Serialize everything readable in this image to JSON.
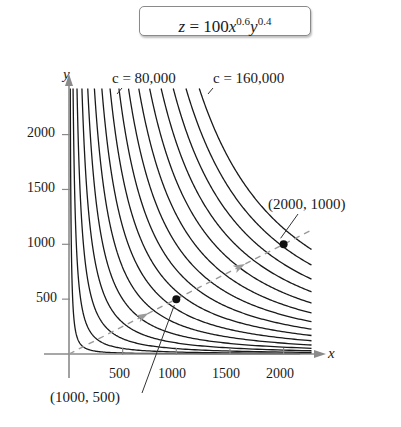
{
  "chart_data": {
    "type": "line",
    "formula": {
      "lhs": "z",
      "eq": " = 100",
      "var_x": "x",
      "exp_x": "0.6",
      "var_y": "y",
      "exp_y": "0.4"
    },
    "xlabel": "x",
    "ylabel": "y",
    "xlim": [
      0,
      2260
    ],
    "ylim": [
      0,
      2420
    ],
    "x_ticks": [
      500,
      1000,
      1500,
      2000
    ],
    "y_ticks": [
      500,
      1000,
      1500,
      2000
    ],
    "x_tick_labels": [
      "500",
      "1000",
      "1500",
      "2000"
    ],
    "y_tick_labels": [
      "500",
      "1000",
      "1500",
      "2000"
    ],
    "grid": false,
    "series": [
      {
        "name": "level curves z = c",
        "levels": [
          10000,
          20000,
          30000,
          40000,
          50000,
          60000,
          70000,
          80000,
          90000,
          100000,
          110000,
          120000,
          130000,
          140000,
          150000,
          160000
        ]
      },
      {
        "name": "expansion path y = x/2",
        "style": "dashed",
        "x": [
          0,
          2260
        ],
        "y": [
          0,
          1130
        ]
      }
    ],
    "annotations": [
      {
        "text": "c = 80,000",
        "level": 80000
      },
      {
        "text": "c = 160,000",
        "level": 160000
      },
      {
        "text": "(1000, 500)",
        "point": [
          1000,
          500
        ]
      },
      {
        "text": "(2000, 1000)",
        "point": [
          2000,
          1000
        ]
      }
    ]
  },
  "labels": {
    "c80": "c = 80,000",
    "c160": "c = 160,000",
    "p1": "(1000, 500)",
    "p2": "(2000, 1000)",
    "x_axis": "x",
    "y_axis": "y",
    "yt500": "500",
    "yt1000": "1000",
    "yt1500": "1500",
    "yt2000": "2000",
    "xt500": "500",
    "xt1000": "1000",
    "xt1500": "1500",
    "xt2000": "2000"
  },
  "colors": {
    "curve": "#1a1a1a",
    "axis": "#8a8a8a",
    "dash": "#9a9a9a"
  }
}
